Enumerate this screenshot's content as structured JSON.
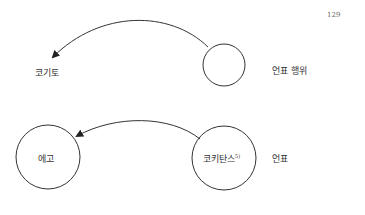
{
  "page_number": "129",
  "diagram_top": {
    "left_label": "코기토",
    "right_label": "언표 행위"
  },
  "diagram_bottom": {
    "left_circle_label": "에고",
    "right_circle_label": "코키탄스",
    "right_circle_footnote": "5)",
    "right_label": "언표"
  }
}
